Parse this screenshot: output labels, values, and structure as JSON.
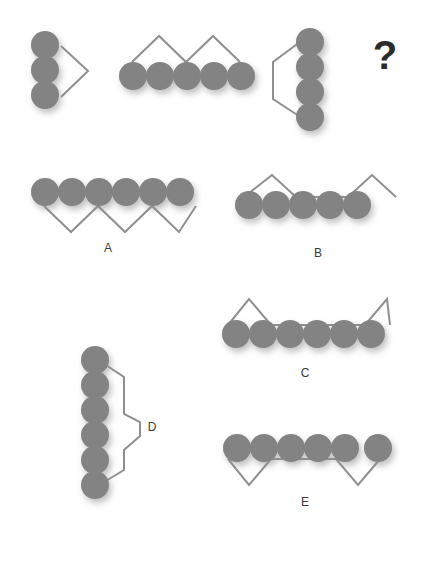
{
  "puzzle": {
    "type": "visual-analogy-matrix",
    "background_color": "#ffffff",
    "circle_color": "#838383",
    "line_color": "#8f8f8f",
    "label_color": "#3a3a3a",
    "question_glyph": "?",
    "circle_radius": 14,
    "line_width": 2,
    "prompt_figures": [
      {
        "id": "prompt-1",
        "name": "three-circles-vertical-with-right-chevron",
        "circle_count": 3,
        "orientation": "vertical",
        "line_shape": "chevron-right",
        "circles": [
          [
            45,
            45
          ],
          [
            45,
            70
          ],
          [
            45,
            95
          ]
        ],
        "polyline": [
          [
            61,
            46
          ],
          [
            88,
            71
          ],
          [
            61,
            97
          ]
        ]
      },
      {
        "id": "prompt-2",
        "name": "five-circles-horizontal-with-double-peak-above",
        "circle_count": 5,
        "orientation": "horizontal",
        "line_shape": "double-peak-above",
        "circles": [
          [
            133,
            76
          ],
          [
            160,
            76
          ],
          [
            187,
            76
          ],
          [
            214,
            76
          ],
          [
            241,
            76
          ]
        ],
        "polyline": [
          [
            132,
            62
          ],
          [
            159,
            36
          ],
          [
            186,
            62
          ],
          [
            213,
            36
          ],
          [
            240,
            62
          ]
        ]
      },
      {
        "id": "prompt-3",
        "name": "four-circles-vertical-with-left-bracket",
        "circle_count": 4,
        "orientation": "vertical",
        "line_shape": "bracket-left",
        "circles": [
          [
            310,
            42
          ],
          [
            310,
            67
          ],
          [
            310,
            92
          ],
          [
            310,
            117
          ]
        ],
        "polyline": [
          [
            308,
            36
          ],
          [
            273,
            62
          ],
          [
            273,
            99
          ],
          [
            308,
            122
          ]
        ]
      }
    ],
    "question_cell": {
      "id": "question-cell",
      "name": "missing-figure-question-mark",
      "position": [
        385,
        58
      ]
    },
    "options": [
      {
        "id": "option-a",
        "label": "A",
        "name": "six-circles-horizontal-with-triple-valley-below",
        "circle_count": 6,
        "orientation": "horizontal",
        "line_shape": "triple-valley-below",
        "circles": [
          [
            45,
            192
          ],
          [
            72,
            192
          ],
          [
            99,
            192
          ],
          [
            126,
            192
          ],
          [
            153,
            192
          ],
          [
            180,
            192
          ]
        ],
        "polyline": [
          [
            44,
            206
          ],
          [
            71,
            232
          ],
          [
            98,
            206
          ],
          [
            125,
            232
          ],
          [
            152,
            206
          ],
          [
            179,
            232
          ],
          [
            196,
            206
          ]
        ],
        "label_position": [
          108,
          249
        ]
      },
      {
        "id": "option-b",
        "label": "B",
        "name": "five-circles-horizontal-with-double-peak-flat-middle-above",
        "circle_count": 5,
        "orientation": "horizontal",
        "line_shape": "double-peak-flat-middle-above",
        "circles": [
          [
            249,
            205
          ],
          [
            276,
            205
          ],
          [
            303,
            205
          ],
          [
            330,
            205
          ],
          [
            357,
            205
          ]
        ],
        "polyline": [
          [
            244,
            197
          ],
          [
            272,
            175
          ],
          [
            296,
            197
          ],
          [
            348,
            197
          ],
          [
            372,
            175
          ],
          [
            396,
            197
          ]
        ],
        "label_position": [
          318,
          254
        ]
      },
      {
        "id": "option-c",
        "label": "C",
        "name": "six-circles-horizontal-with-outer-peaks-flat-middle-above",
        "circle_count": 6,
        "orientation": "horizontal",
        "line_shape": "outer-peaks-flat-middle-above",
        "circles": [
          [
            236,
            334
          ],
          [
            263,
            334
          ],
          [
            290,
            334
          ],
          [
            317,
            334
          ],
          [
            344,
            334
          ],
          [
            371,
            334
          ]
        ],
        "polyline": [
          [
            228,
            325
          ],
          [
            249,
            299
          ],
          [
            271,
            325
          ],
          [
            365,
            325
          ],
          [
            387,
            299
          ],
          [
            390,
            325
          ]
        ],
        "label_position": [
          305,
          374
        ]
      },
      {
        "id": "option-d",
        "label": "D",
        "name": "six-circles-vertical-with-double-zigzag-right",
        "circle_count": 6,
        "orientation": "vertical",
        "line_shape": "double-zigzag-right",
        "circles": [
          [
            95,
            360
          ],
          [
            95,
            385
          ],
          [
            95,
            410
          ],
          [
            95,
            435
          ],
          [
            95,
            460
          ],
          [
            95,
            485
          ]
        ],
        "polyline": [
          [
            89,
            354
          ],
          [
            124,
            377
          ],
          [
            124,
            414
          ],
          [
            140,
            422
          ],
          [
            140,
            436
          ],
          [
            124,
            450
          ],
          [
            124,
            470
          ],
          [
            89,
            491
          ]
        ],
        "label_position": [
          152,
          428
        ]
      },
      {
        "id": "option-e",
        "label": "E",
        "name": "six-circles-horizontal-with-double-valley-flat-middle-below",
        "circle_count": 6,
        "orientation": "horizontal",
        "line_shape": "double-valley-flat-middle-below",
        "circles": [
          [
            237,
            448
          ],
          [
            264,
            448
          ],
          [
            291,
            448
          ],
          [
            318,
            448
          ],
          [
            345,
            448
          ],
          [
            378,
            448
          ]
        ],
        "polyline": [
          [
            228,
            459
          ],
          [
            249,
            485
          ],
          [
            271,
            459
          ],
          [
            336,
            459
          ],
          [
            358,
            485
          ],
          [
            380,
            459
          ]
        ],
        "label_position": [
          305,
          503
        ]
      }
    ]
  }
}
